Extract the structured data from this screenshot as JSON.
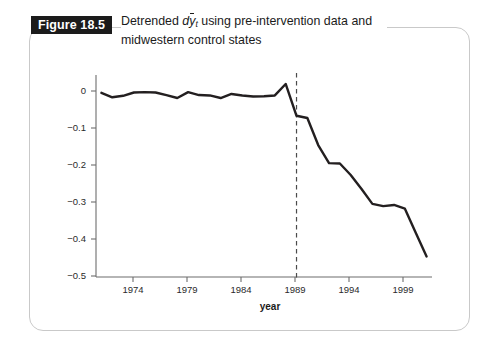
{
  "figure": {
    "label": "Figure 18.5",
    "caption_line1_prefix": "Detrended ",
    "caption_var": "d",
    "caption_var_y": "y",
    "caption_var_sub": "t",
    "caption_line1_suffix": " using pre-intervention data and",
    "caption_line2": "midwestern control states",
    "caption_full": "Detrended dȳt using pre-intervention data and midwestern control states"
  },
  "colors": {
    "line": "#231f20",
    "axis": "#6d6d6d",
    "frame_border": "#c9c9c9",
    "label_box": "#1b1b1b",
    "label_text": "#ffffff",
    "intervention_line": "#4a4a4a"
  },
  "chart_data": {
    "type": "line",
    "xlabel": "year",
    "ylabel": "",
    "xlim": [
      1970.5,
      2001.5
    ],
    "ylim": [
      -0.5,
      0.04
    ],
    "grid": false,
    "legend": null,
    "yticks": [
      0,
      -0.1,
      -0.2,
      -0.3,
      -0.4,
      -0.5
    ],
    "ytick_labels": [
      "0",
      "−0.1",
      "−0.2",
      "−0.3",
      "−0.4",
      "−0.5"
    ],
    "xticks": [
      1974,
      1979,
      1984,
      1989,
      1994,
      1999
    ],
    "xtick_labels": [
      "1974",
      "1979",
      "1984",
      "1989",
      "1994",
      "1999"
    ],
    "annotations": [
      {
        "type": "vline",
        "x": 1989,
        "style": "dashed",
        "label": "intervention"
      }
    ],
    "series": [
      {
        "name": "Detrended dy-bar",
        "x": [
          1971,
          1972,
          1973,
          1974,
          1975,
          1976,
          1977,
          1978,
          1979,
          1980,
          1981,
          1982,
          1983,
          1984,
          1985,
          1986,
          1987,
          1988,
          1989,
          1990,
          1991,
          1992,
          1993,
          1994,
          1995,
          1996,
          1997,
          1998,
          1999,
          2000,
          2001
        ],
        "y": [
          -0.005,
          -0.017,
          -0.013,
          -0.004,
          -0.003,
          -0.004,
          -0.011,
          -0.019,
          -0.003,
          -0.011,
          -0.012,
          -0.019,
          -0.008,
          -0.012,
          -0.015,
          -0.014,
          -0.012,
          0.019,
          -0.067,
          -0.073,
          -0.146,
          -0.195,
          -0.196,
          -0.227,
          -0.265,
          -0.305,
          -0.311,
          -0.308,
          -0.318,
          -0.383,
          -0.447
        ]
      }
    ]
  }
}
